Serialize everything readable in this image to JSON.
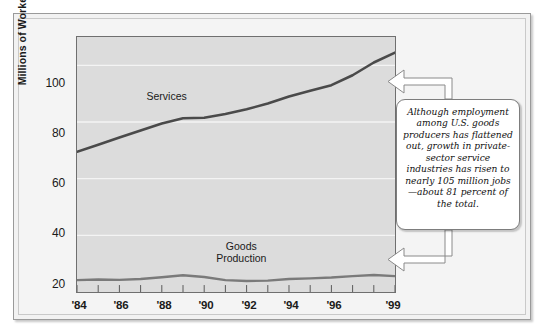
{
  "chart_data": {
    "type": "line",
    "title": "",
    "xlabel": "",
    "ylabel": "Millions of Workers",
    "ylim": [
      20,
      110
    ],
    "xlim": [
      1984,
      1999
    ],
    "grid": true,
    "legend_position": "inline-labels",
    "y_ticks": [
      "20",
      "40",
      "60",
      "80",
      "100"
    ],
    "y_tick_values": [
      20,
      40,
      60,
      80,
      100
    ],
    "x_ticks": [
      "'84",
      "'86",
      "'88",
      "'90",
      "'92",
      "'94",
      "'96",
      "'99"
    ],
    "x_tick_values": [
      1984,
      1986,
      1988,
      1990,
      1992,
      1994,
      1996,
      1999
    ],
    "x": [
      1984,
      1985,
      1986,
      1987,
      1988,
      1989,
      1990,
      1991,
      1992,
      1993,
      1994,
      1995,
      1996,
      1997,
      1998,
      1999
    ],
    "series": [
      {
        "name": "Services",
        "color": "#4a4a4a",
        "values": [
          69.5,
          72.0,
          74.5,
          77.0,
          79.5,
          81.3,
          81.5,
          82.8,
          84.5,
          86.5,
          89.0,
          91.0,
          93.0,
          96.5,
          101.0,
          104.5
        ]
      },
      {
        "name": "Goods Production",
        "color": "#7a7a7a",
        "values": [
          24.2,
          24.4,
          24.3,
          24.6,
          25.2,
          25.9,
          25.3,
          24.2,
          23.9,
          24.0,
          24.6,
          24.8,
          25.1,
          25.6,
          26.0,
          25.6
        ]
      }
    ],
    "annotations": [
      {
        "name": "services-inline-label",
        "text": "Services",
        "x": 1988.2,
        "y": 88.5
      },
      {
        "name": "goods-inline-label",
        "line1": "Goods",
        "line2": "Production",
        "x": 1991.7,
        "y": 36.0
      }
    ],
    "callout": {
      "text": "Although employment among U.S. goods producers has flattened out, growth in private-sector service industries has risen to nearly 105 million jobs—about 81 percent of the total.",
      "points_to": [
        "services-line-end",
        "goods-line-end"
      ]
    }
  },
  "axes": {
    "y_title": "Millions of Workers",
    "y_ticks": [
      "100",
      "80",
      "60",
      "40",
      "20"
    ],
    "x_ticks": [
      "'84",
      "'86",
      "'88",
      "'90",
      "'92",
      "'94",
      "'96",
      "'99"
    ]
  },
  "labels": {
    "services": "Services",
    "goods_line1": "Goods",
    "goods_line2": "Production"
  },
  "callout": {
    "text": "Although employment among U.S. goods producers has flattened out, growth in private-sector service industries has risen to nearly 105 million jobs—about 81 percent of the total."
  },
  "colors": {
    "plot_background": "#dcdcdc",
    "figure_background": "#f3f3f3",
    "services_line": "#4a4a4a",
    "goods_line": "#7a7a7a",
    "gridline": "#f4f4f4",
    "frame_border": "#6f6f6f",
    "callout_border": "#7d7d7d"
  }
}
